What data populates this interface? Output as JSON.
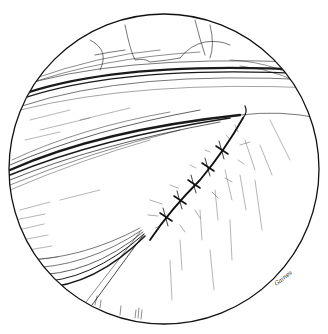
{
  "illustration": {
    "subject": "pen-and-ink illustration of sutured tissue in circular field of view",
    "circle": {
      "cx": 164,
      "cy": 169,
      "r": 155
    },
    "ink_color": "#1a1a1a",
    "background_color": "#ffffff",
    "suture_stitch_count": 5,
    "signature": "Gaines"
  }
}
